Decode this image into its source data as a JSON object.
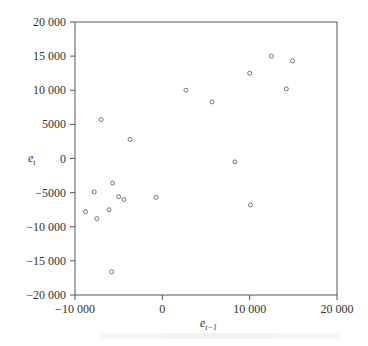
{
  "chart_data": {
    "type": "scatter",
    "title": "",
    "xlabel": "e_{t-1}",
    "ylabel": "e_t",
    "xlim": [
      -10000,
      20000
    ],
    "ylim": [
      -20000,
      20000
    ],
    "xticks": [
      -10000,
      0,
      10000,
      20000
    ],
    "xtick_labels": [
      "−10 000",
      "0",
      "10 000",
      "20 000"
    ],
    "yticks": [
      20000,
      15000,
      10000,
      5000,
      0,
      -5000,
      -10000,
      -15000,
      -20000
    ],
    "ytick_labels": [
      "20 000",
      "15 000",
      "10 000",
      "5000",
      "0",
      "−5000",
      "−10 000",
      "−15 000",
      "−20 000"
    ],
    "grid": false,
    "legend": null,
    "marker": "open-circle",
    "series": [
      {
        "name": "residuals",
        "points": [
          {
            "x": -7000,
            "y": 5700
          },
          {
            "x": -3700,
            "y": 2800
          },
          {
            "x": -5700,
            "y": -3600
          },
          {
            "x": -7800,
            "y": -4900
          },
          {
            "x": -5000,
            "y": -5600
          },
          {
            "x": -4400,
            "y": -6000
          },
          {
            "x": -700,
            "y": -5700
          },
          {
            "x": -8800,
            "y": -7800
          },
          {
            "x": -6100,
            "y": -7500
          },
          {
            "x": -7500,
            "y": -8800
          },
          {
            "x": -5800,
            "y": -16600
          },
          {
            "x": 2700,
            "y": 10000
          },
          {
            "x": 5700,
            "y": 8300
          },
          {
            "x": 10000,
            "y": 12500
          },
          {
            "x": 12500,
            "y": 15000
          },
          {
            "x": 14900,
            "y": 14300
          },
          {
            "x": 14200,
            "y": 10200
          },
          {
            "x": 8300,
            "y": -500
          },
          {
            "x": 10100,
            "y": -6800
          }
        ]
      }
    ]
  },
  "labels": {
    "y_axis_main": "e",
    "y_axis_sub": "t",
    "x_axis_main": "e",
    "x_axis_sub": "t−1"
  },
  "colors": {
    "axis": "#555555",
    "marker": "#666666",
    "text": "#333333"
  }
}
